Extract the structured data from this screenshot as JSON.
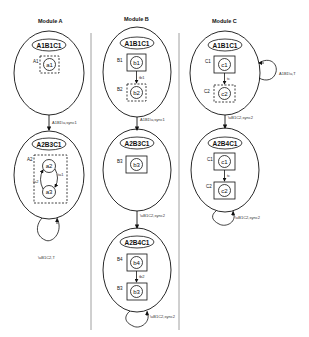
{
  "modules": [
    {
      "title": "Module A",
      "states": [
        {
          "name": "A1B1C1",
          "components": [
            {
              "label": "A1",
              "inner": "a1",
              "box": "dashed"
            }
          ]
        },
        {
          "name": "A2B3C1",
          "components": [
            {
              "label": "A2",
              "inners": [
                "a2",
                "a3"
              ],
              "box": "dashed",
              "transitions": [
                "ta1",
                "ta2"
              ]
            }
          ]
        }
      ],
      "transitions": [
        {
          "from": "A1B1C1",
          "to": "A2B3C1",
          "label": "A1B1\\u,sync1"
        },
        {
          "from": "A2B3C1",
          "to": "A2B3C1",
          "label": "\\uB1C2,T"
        }
      ]
    },
    {
      "title": "Module B",
      "states": [
        {
          "name": "A1B1C1",
          "components": [
            {
              "label": "B1",
              "inner": "b1",
              "box": "solid"
            },
            {
              "label": "B2",
              "inner": "b2",
              "box": "dashed"
            }
          ],
          "internal_transition": "tb1"
        },
        {
          "name": "A2B3C1",
          "components": [
            {
              "label": "B3",
              "inner": "b3",
              "box": "solid"
            }
          ]
        },
        {
          "name": "A2B4C1",
          "components": [
            {
              "label": "B4",
              "inner": "b4",
              "box": "solid"
            },
            {
              "label": "B3",
              "inner": "b3",
              "box": "solid"
            }
          ],
          "internal_transition": "tb2"
        }
      ],
      "transitions": [
        {
          "from": "A1B1C1",
          "to": "A2B3C1",
          "label": "A1B1\\u,sync1"
        },
        {
          "from": "A2B3C1",
          "to": "A2B4C1",
          "label": "\\uB1C2,sync2"
        },
        {
          "from": "A2B4C1",
          "to": "A2B4C1",
          "label": "\\uB1C2,sync2"
        }
      ]
    },
    {
      "title": "Module C",
      "states": [
        {
          "name": "A1B1C1",
          "components": [
            {
              "label": "C1",
              "inner": "c1",
              "box": "solid"
            },
            {
              "label": "C2",
              "inner": "c2",
              "box": "dashed"
            }
          ],
          "internal_transition": "tc"
        },
        {
          "name": "A2B4C1",
          "components": [
            {
              "label": "C1",
              "inner": "c1",
              "box": "solid"
            },
            {
              "label": "C2",
              "inner": "c2",
              "box": "solid"
            }
          ],
          "internal_transition": "tc"
        }
      ],
      "transitions": [
        {
          "from": "A1B1C1",
          "to": "A1B1C1",
          "label": "A1B1\\u,T"
        },
        {
          "from": "A1B1C1",
          "to": "A2B4C1",
          "label": "\\uB1C2,sync2"
        },
        {
          "from": "A2B4C1",
          "to": "A2B4C1",
          "label": "\\uB1C2,sync2"
        }
      ]
    }
  ]
}
